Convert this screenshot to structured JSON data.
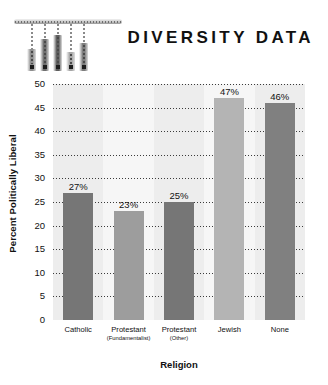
{
  "header": {
    "title": "DIVERSITY DATA",
    "decoration": {
      "name": "hanging-bars-graphic",
      "bars": [
        {
          "height": 22,
          "top": 30,
          "left": 13,
          "color": "#8e8e8e"
        },
        {
          "height": 32,
          "top": 20,
          "left": 26,
          "color": "#6f6f6f"
        },
        {
          "height": 36,
          "top": 16,
          "left": 39,
          "color": "#5e5e5e"
        },
        {
          "height": 19,
          "top": 33,
          "left": 52,
          "color": "#a6a6a6"
        },
        {
          "height": 28,
          "top": 24,
          "left": 65,
          "color": "#7d7d7d"
        }
      ]
    }
  },
  "chart_data": {
    "type": "bar",
    "title": "DIVERSITY DATA",
    "xlabel": "Religion",
    "ylabel": "Percent Politically Liberal",
    "categories": [
      "Catholic",
      "Protestant",
      "Protestant",
      "Jewish",
      "None"
    ],
    "category_sublabels": [
      "",
      "(Fundamentalist)",
      "(Other)",
      "",
      ""
    ],
    "values": [
      27,
      23,
      25,
      47,
      46
    ],
    "value_labels": [
      "27%",
      "23%",
      "25%",
      "47%",
      "46%"
    ],
    "bar_colors": [
      "#767676",
      "#9d9d9d",
      "#767676",
      "#b4b4b4",
      "#808080"
    ],
    "ylim": [
      0,
      50
    ],
    "yticks": [
      50,
      45,
      40,
      35,
      30,
      25,
      20,
      15,
      10,
      5,
      0
    ],
    "ytick_labels": [
      "50",
      "45",
      "40",
      "35",
      "30",
      "25",
      "20",
      "15",
      "10",
      "5",
      "0"
    ],
    "grid": true,
    "grid_style": "dotted-horizontal",
    "legend": "none",
    "plot_background": "#f0f0f0",
    "band_colors": [
      "#ededed",
      "#f6f6f6"
    ]
  }
}
